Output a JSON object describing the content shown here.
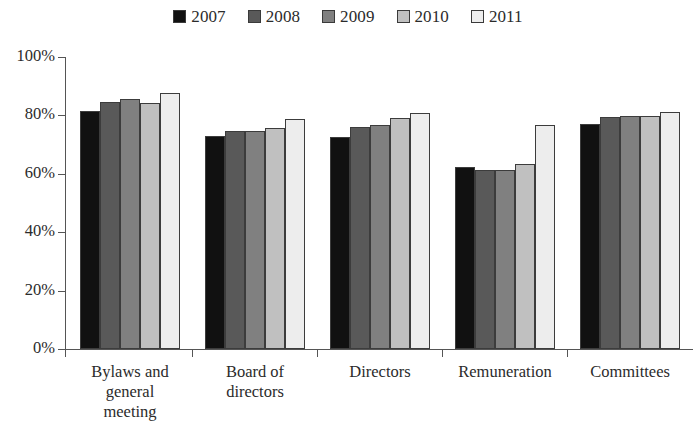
{
  "chart_data": {
    "type": "bar",
    "title": "",
    "xlabel": "",
    "ylabel": "",
    "ylim": [
      0,
      100
    ],
    "ytick_labels": [
      "100%",
      "80%",
      "60%",
      "40%",
      "20%",
      "0%"
    ],
    "ytick_values": [
      100,
      80,
      60,
      40,
      20,
      0
    ],
    "grid": false,
    "legend_position": "top-center",
    "categories": [
      "Bylaws and general meeting",
      "Board of directors",
      "Directors",
      "Remuneration",
      "Committees"
    ],
    "category_lines": [
      [
        "Bylaws and",
        "general",
        "meeting"
      ],
      [
        "Board of",
        "directors"
      ],
      [
        "Directors"
      ],
      [
        "Remuneration"
      ],
      [
        "Committees"
      ]
    ],
    "series": [
      {
        "name": "2007",
        "color": "#111111",
        "values": [
          81.5,
          73.0,
          72.6,
          62.3,
          77.0
        ]
      },
      {
        "name": "2008",
        "color": "#595959",
        "values": [
          84.6,
          74.7,
          76.0,
          61.3,
          79.5
        ]
      },
      {
        "name": "2009",
        "color": "#808080",
        "values": [
          85.6,
          74.7,
          76.7,
          61.3,
          79.8
        ]
      },
      {
        "name": "2010",
        "color": "#c0c0c0",
        "values": [
          84.2,
          75.7,
          79.1,
          63.4,
          79.8
        ]
      },
      {
        "name": "2011",
        "color": "#ededed",
        "values": [
          87.8,
          78.8,
          80.8,
          76.7,
          81.2
        ]
      }
    ]
  },
  "legend": {
    "entries": [
      {
        "label": "2007",
        "color": "#111111"
      },
      {
        "label": "2008",
        "color": "#595959"
      },
      {
        "label": "2009",
        "color": "#808080"
      },
      {
        "label": "2010",
        "color": "#c0c0c0"
      },
      {
        "label": "2011",
        "color": "#ededed"
      }
    ]
  },
  "axis": {
    "y_labels": [
      "100%",
      "80%",
      "60%",
      "40%",
      "20%",
      "0%"
    ]
  }
}
